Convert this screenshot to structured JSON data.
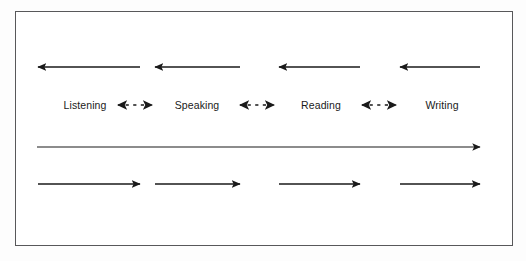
{
  "figure": {
    "type": "diagram",
    "frame": {
      "border_color": "#58585a",
      "background_color": "#ffffff"
    },
    "canvas_background": "#fdfdfd",
    "stroke_color": "#1a1a1a"
  },
  "skills": [
    {
      "label": "Listening",
      "center_x": 85
    },
    {
      "label": "Speaking",
      "center_x": 197
    },
    {
      "label": "Reading",
      "center_x": 321
    },
    {
      "label": "Writing",
      "center_x": 442
    }
  ],
  "rows": {
    "top_arrows": {
      "name": "left-pointing arrows row",
      "direction": "left",
      "y": 67,
      "count": 4,
      "segments": [
        {
          "x1": 140,
          "x2": 38
        },
        {
          "x1": 240,
          "x2": 155
        },
        {
          "x1": 360,
          "x2": 279
        },
        {
          "x1": 480,
          "x2": 400
        }
      ]
    },
    "bidirectional_arrows": {
      "name": "bidirectional dashed arrows row",
      "direction": "both",
      "y": 105,
      "count": 3,
      "segments": [
        {
          "x1": 118,
          "x2": 152
        },
        {
          "x1": 240,
          "x2": 274
        },
        {
          "x1": 362,
          "x2": 396
        }
      ]
    },
    "long_arrow": {
      "name": "full width right arrow",
      "direction": "right",
      "y": 147,
      "count": 1,
      "segments": [
        {
          "x1": 37,
          "x2": 480
        }
      ]
    },
    "bottom_arrows": {
      "name": "right-pointing arrows row",
      "direction": "right",
      "y": 184,
      "count": 4,
      "segments": [
        {
          "x1": 38,
          "x2": 140
        },
        {
          "x1": 155,
          "x2": 240
        },
        {
          "x1": 279,
          "x2": 360
        },
        {
          "x1": 400,
          "x2": 480
        }
      ]
    }
  }
}
